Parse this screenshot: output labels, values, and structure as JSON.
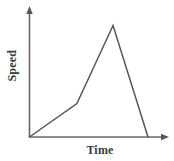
{
  "chart_data": {
    "type": "line",
    "title": "",
    "xlabel": "Time",
    "ylabel": "Speed",
    "x": [
      0,
      0.4,
      0.705,
      1.0
    ],
    "values": [
      0,
      0.3,
      1.0,
      0.0
    ],
    "series": [
      {
        "name": "speed",
        "points": [
          {
            "x": 0.0,
            "y": 0.0,
            "note": "start at origin"
          },
          {
            "x": 0.4,
            "y": 0.3,
            "note": "slope increases"
          },
          {
            "x": 0.705,
            "y": 1.0,
            "note": "peak speed"
          },
          {
            "x": 1.0,
            "y": 0.0,
            "note": "returns to rest"
          }
        ],
        "values": [
          0,
          0.3,
          1.0,
          0.0
        ]
      }
    ],
    "xlim": [
      0,
      1
    ],
    "ylim": [
      0,
      1
    ],
    "grid": false,
    "legend": false,
    "xticklabels": [],
    "yticklabels": [],
    "axis_arrows": true,
    "line_color": "#555555",
    "axis_color": "#666666",
    "background": "#ffffff"
  },
  "labels": {
    "ylabel": "Speed",
    "xlabel": "Time"
  }
}
